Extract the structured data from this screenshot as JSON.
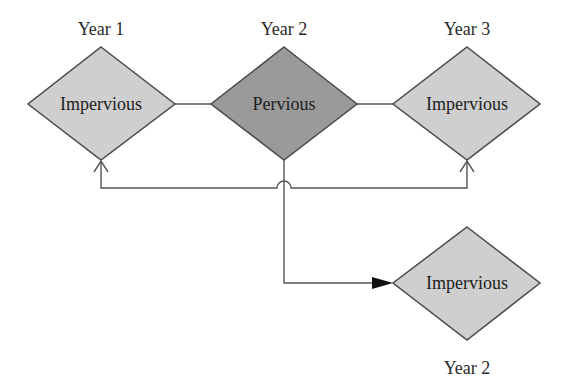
{
  "diagram": {
    "colors": {
      "impervious_fill": "#cfcfcf",
      "pervious_fill": "#9a9a9a",
      "stroke": "#4a4a4a",
      "line": "#555555",
      "text": "#222222"
    },
    "nodes": [
      {
        "id": "n1",
        "label": "Impervious",
        "year_label": "Year 1",
        "type": "impervious"
      },
      {
        "id": "n2",
        "label": "Pervious",
        "year_label": "Year 2",
        "type": "pervious"
      },
      {
        "id": "n3",
        "label": "Impervious",
        "year_label": "Year 3",
        "type": "impervious"
      },
      {
        "id": "n4",
        "label": "Impervious",
        "year_label": "Year 2",
        "type": "impervious"
      }
    ],
    "edges": [
      {
        "from": "n1",
        "to": "n2",
        "style": "plain line"
      },
      {
        "from": "n2",
        "to": "n3",
        "style": "plain line"
      },
      {
        "from": "feedback-line",
        "to": "n1",
        "style": "open arrow"
      },
      {
        "from": "feedback-line",
        "to": "n3",
        "style": "open arrow"
      },
      {
        "from": "n2",
        "to": "n4",
        "style": "filled arrow"
      }
    ]
  }
}
